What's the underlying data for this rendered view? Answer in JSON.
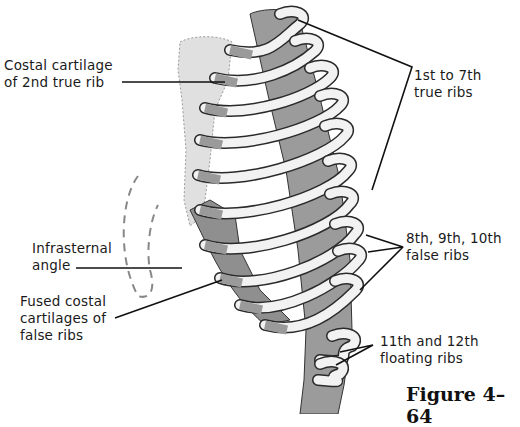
{
  "figure": {
    "caption": "Figure 4–64"
  },
  "labels": {
    "costal_cartilage_2nd": [
      "Costal cartilage",
      "of 2nd true rib"
    ],
    "true_ribs": [
      "1st to 7th",
      "true ribs"
    ],
    "infrasternal_angle": [
      "Infrasternal",
      "angle"
    ],
    "fused_costal": [
      "Fused costal",
      "cartilages of",
      "false ribs"
    ],
    "false_ribs": [
      "8th, 9th, 10th",
      "false ribs"
    ],
    "floating_ribs": [
      "11th and 12th",
      "floating ribs"
    ]
  },
  "colors": {
    "bone_light": "#f2f2f2",
    "cartilage_gray": "#9a9a9a",
    "spine_gray": "#8c8c8c",
    "sternum_gray": "#dcdcdc",
    "outline": "#2a2a2a",
    "leader_line": "#111111"
  }
}
